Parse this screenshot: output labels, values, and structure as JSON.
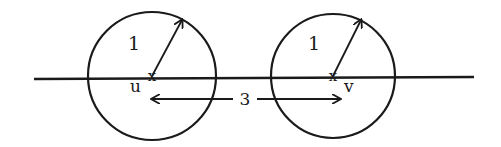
{
  "diagram": {
    "stroke_color": "#1a1a1a",
    "background": "#ffffff",
    "axis_line": {
      "x1": 34,
      "y1": 79,
      "x2": 474,
      "y2": 77
    },
    "nodes": [
      {
        "id": "u",
        "label": "u",
        "cx": 152,
        "cy": 76,
        "r": 64,
        "radius_label": "1",
        "radius_tip": {
          "x": 182,
          "y": 20
        },
        "label_pos": {
          "x": 130,
          "y": 92
        },
        "radius_label_pos": {
          "x": 128,
          "y": 50
        }
      },
      {
        "id": "v",
        "label": "v",
        "cx": 333,
        "cy": 76,
        "r": 62,
        "radius_label": "1",
        "radius_tip": {
          "x": 361,
          "y": 20
        },
        "label_pos": {
          "x": 344,
          "y": 92
        },
        "radius_label_pos": {
          "x": 308,
          "y": 50
        }
      }
    ],
    "distance": {
      "label": "3",
      "y": 99,
      "x_start": 152,
      "x_end": 340,
      "label_pos": {
        "x": 245,
        "y": 105
      }
    }
  }
}
